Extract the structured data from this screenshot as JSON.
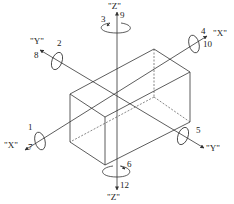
{
  "diagram": {
    "colors": {
      "line": "#333333",
      "background": "#ffffff"
    },
    "axes": {
      "z": {
        "label_top": "\"Z\"",
        "label_bottom": "\"Z\"",
        "top_numbers": {
          "rotation": "3",
          "translation": "9"
        },
        "bottom_numbers": {
          "rotation": "6",
          "translation": "12"
        }
      },
      "x": {
        "label_right": "\"X\"",
        "label_left": "\"X\"",
        "right_numbers": {
          "rotation": "4",
          "translation": "10"
        },
        "left_numbers": {
          "rotation": "1",
          "translation": "7"
        }
      },
      "y": {
        "label_upper_left": "\"Y\"",
        "label_lower_right": "\"Y\"",
        "upper_left_numbers": {
          "rotation": "2",
          "translation": "8"
        },
        "lower_right_numbers": {
          "rotation": "5"
        }
      }
    }
  }
}
